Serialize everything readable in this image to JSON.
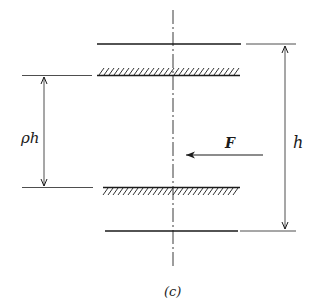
{
  "figure": {
    "caption": "(c)",
    "colors": {
      "ink": "#1a1a1a",
      "thin_line": "#3a3a3a",
      "background": "#ffffff"
    }
  },
  "labels": {
    "gap_dimension": "ρh",
    "total_dimension": "h",
    "force": "F"
  },
  "elements": {
    "centerline": {
      "x": 173,
      "y1": 10,
      "y2": 268,
      "style": "dash-dot"
    },
    "top_plate": {
      "y": 44,
      "x1": 97,
      "x2": 241
    },
    "top_hatched_surface": {
      "y": 75,
      "x1": 97,
      "x2": 240,
      "hatch_side": "above"
    },
    "bottom_hatched_surface": {
      "y": 188,
      "x1": 103,
      "x2": 240,
      "hatch_side": "below"
    },
    "bottom_plate": {
      "y": 231,
      "x1": 105,
      "x2": 238
    },
    "gap_dimension_line": {
      "x": 44,
      "y1": 75,
      "y2": 188
    },
    "total_dimension_line": {
      "x": 285,
      "y1": 44,
      "y2": 231
    },
    "force_arrow": {
      "y": 155,
      "x_tail": 263,
      "x_head": 186,
      "direction": "left"
    }
  }
}
